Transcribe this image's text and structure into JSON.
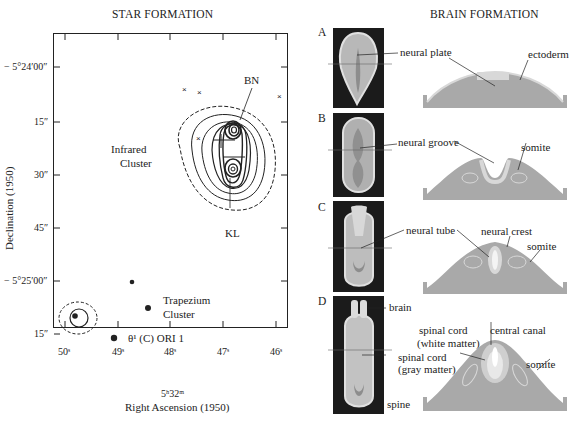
{
  "left": {
    "title": "STAR FORMATION",
    "y_axis_title": "Declination (1950)",
    "x_axis_title": "Right Ascension (1950)",
    "x_axis_subtitle": "5ʰ32ᵐ",
    "y_ticks": [
      "− 5°24′00″",
      "15″",
      "30″",
      "45″",
      "− 5°25′00″",
      "15″"
    ],
    "x_ticks": [
      "50ˢ",
      "49ˢ",
      "48ˢ",
      "47ˢ",
      "46ˢ"
    ],
    "labels": {
      "bn": "BN",
      "kl": "KL",
      "infrared_line1": "Infrared",
      "infrared_line2": "Cluster",
      "trapezium_line1": "Trapezium",
      "trapezium_line2": "Cluster",
      "theta": "θ¹ (C) ORI 1"
    }
  },
  "right": {
    "title": "BRAIN FORMATION",
    "panels": [
      {
        "letter": "A",
        "labels": [
          "neural plate",
          "ectoderm"
        ]
      },
      {
        "letter": "B",
        "labels": [
          "neural groove",
          "somite"
        ]
      },
      {
        "letter": "C",
        "labels": [
          "neural tube",
          "neural crest",
          "somite"
        ]
      },
      {
        "letter": "D",
        "labels": [
          "brain",
          "spinal cord",
          "(white matter)",
          "central canal",
          "spinal cord",
          "(gray matter)",
          "somite",
          "spine"
        ]
      }
    ]
  },
  "colors": {
    "ink": "#222222",
    "embryo_bg": "#1b1b1b",
    "tissue": "#a9a9a9",
    "tissue_light": "#d8d8d8"
  }
}
